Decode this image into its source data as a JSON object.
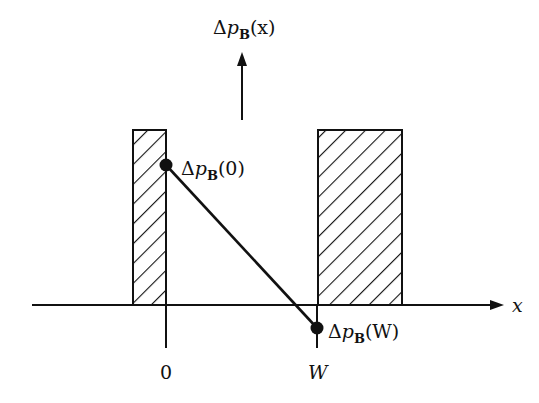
{
  "diagram": {
    "y_axis_label": {
      "delta": "Δ",
      "var": "p",
      "sub": "B",
      "arg": "(x)"
    },
    "x_axis_label": "x",
    "point_0_label": {
      "delta": "Δ",
      "var": "p",
      "sub": "B",
      "arg": "(0)"
    },
    "point_W_label": {
      "delta": "Δ",
      "var": "p",
      "sub": "B",
      "arg": "(W)"
    },
    "tick_0": "0",
    "tick_W": "W",
    "colors": {
      "ink": "#111111",
      "background": "#ffffff"
    },
    "regions": [
      {
        "name": "left-shaded-region",
        "x0": 133,
        "x1": 166,
        "y0": 130,
        "y1": 305
      },
      {
        "name": "right-shaded-region",
        "x0": 318,
        "x1": 402,
        "y0": 130,
        "y1": 305
      }
    ],
    "line": {
      "from": [
        166,
        165
      ],
      "to": [
        317,
        328
      ]
    }
  }
}
